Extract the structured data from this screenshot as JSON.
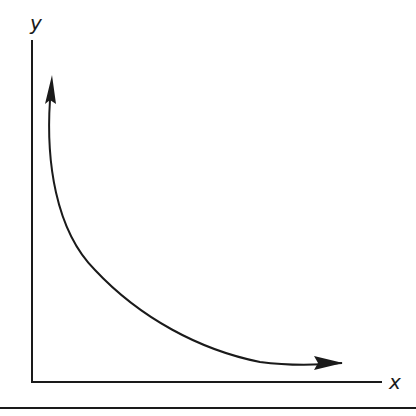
{
  "diagram": {
    "type": "curve-sketch",
    "x_axis_label": "x",
    "y_axis_label": "y",
    "curve_shape": "decreasing-convex",
    "arrowheads": [
      "top-end",
      "right-end"
    ],
    "line_color": "#1a1a1a"
  }
}
